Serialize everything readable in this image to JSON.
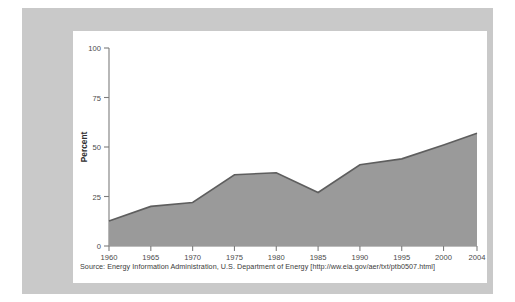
{
  "chart_data": {
    "type": "area",
    "title": "",
    "xlabel": "",
    "ylabel": "Percent",
    "xlim": [
      1960,
      2004
    ],
    "ylim": [
      0,
      100
    ],
    "grid": false,
    "legend": "none",
    "series_color": "#9a9a9a",
    "line_color": "#5e5e5e",
    "x_tick_labels": [
      "1960",
      "1965",
      "1970",
      "1975",
      "1980",
      "1985",
      "1990",
      "1995",
      "2000",
      "2004"
    ],
    "x_ticks": [
      1960,
      1965,
      1970,
      1975,
      1980,
      1985,
      1990,
      1995,
      2000,
      2004
    ],
    "y_tick_labels": [
      "0",
      "25",
      "50",
      "75",
      "100"
    ],
    "y_ticks": [
      0,
      25,
      50,
      75,
      100
    ],
    "x": [
      1960,
      1965,
      1970,
      1975,
      1980,
      1985,
      1990,
      1995,
      2000,
      2004
    ],
    "values": [
      12.6,
      20.0,
      22.0,
      36.0,
      37.0,
      27.0,
      41.0,
      44.0,
      51.0,
      57.0
    ],
    "series": [
      {
        "name": "Percent",
        "values": [
          12.6,
          20.0,
          22.0,
          36.0,
          37.0,
          27.0,
          41.0,
          44.0,
          51.0,
          57.0
        ]
      }
    ],
    "annotations": []
  },
  "axes": {
    "y_label": "Percent"
  },
  "footer": {
    "source_note": "Source: Energy Information Administration, U.S. Department of Energy [http://ww.eia.gov/aer/txt/ptb0507.html]"
  },
  "colors": {
    "mat": "#c9c9c9",
    "card": "#ffffff",
    "area": "#9a9a9a",
    "line": "#5e5e5e",
    "axis": "#7d7d7d",
    "text": "#3a3a3a"
  }
}
